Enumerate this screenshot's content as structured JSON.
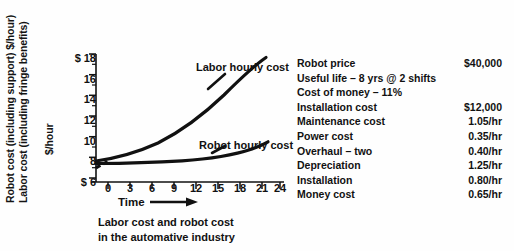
{
  "axis_labels": {
    "robot_cost": "Robot cost (including support) $/hour)",
    "labor_cost": "Labor cost (including fringe benefits)",
    "unit": "$/hour",
    "time": "Time"
  },
  "caption": {
    "line1": "Labor cost and robot cost",
    "line2": "in the automative industry"
  },
  "specs": {
    "rows": [
      {
        "label": "Robot price",
        "value": "$40,000"
      },
      {
        "label": "Useful life – 8 yrs @ 2 shifts",
        "value": ""
      },
      {
        "label": "Cost of money – 11%",
        "value": ""
      },
      {
        "label": "Installation cost",
        "value": "$12,000"
      },
      {
        "label": "Maintenance cost",
        "value": "1.05/hr"
      },
      {
        "label": "Power cost",
        "value": "0.35/hr"
      },
      {
        "label": "Overhaul – two",
        "value": "0.40/hr"
      },
      {
        "label": "Depreciation",
        "value": "1.25/hr"
      },
      {
        "label": "Installation",
        "value": "0.80/hr"
      },
      {
        "label": "Money cost",
        "value": "0.65/hr"
      }
    ]
  },
  "chart_data": {
    "type": "line",
    "title": "Labor cost and robot cost in the automative industry",
    "xlabel": "Time",
    "ylabel": "$/hour",
    "xlim": [
      -2,
      25
    ],
    "ylim": [
      5,
      18
    ],
    "grid": false,
    "legend": "inline-annotations",
    "xticks": [
      "0",
      "3",
      "6",
      "9",
      "12",
      "15",
      "18",
      "21",
      "24"
    ],
    "xtick_values": [
      0,
      3,
      6,
      9,
      12,
      15,
      18,
      21,
      24
    ],
    "yticks": [
      "$ 18",
      "16",
      "14",
      "12",
      "10",
      "8",
      "$  6"
    ],
    "ytick_values": [
      18,
      16,
      14,
      12,
      10,
      8,
      6
    ],
    "ytick_prefixes": [
      "$",
      "",
      "",
      "",
      "",
      "",
      "$"
    ],
    "minor_y_ticks": [
      7,
      9,
      11,
      13,
      15,
      17
    ],
    "series": [
      {
        "name": "Labor hourly cost",
        "label_text": "Labor hourly cost",
        "style": "solid",
        "x": [
          0,
          3,
          6,
          9,
          12,
          15,
          18,
          21,
          23.3
        ],
        "values": [
          7.0,
          7.4,
          8.0,
          8.9,
          10.1,
          11.7,
          13.6,
          15.8,
          17.3
        ]
      },
      {
        "name": "Robot hourly cost",
        "label_text": "Robot hourly cost",
        "style": "solid",
        "x": [
          0,
          3,
          6,
          9,
          12,
          15,
          18,
          21,
          23.3
        ],
        "values": [
          6.85,
          6.85,
          6.88,
          6.92,
          7.0,
          7.15,
          7.4,
          7.8,
          8.1
        ]
      },
      {
        "name": "origin dashed lead-in",
        "label_text": "",
        "style": "dashed",
        "x": [
          -1.6,
          -0.8,
          0
        ],
        "values": [
          6.1,
          6.5,
          6.9
        ]
      }
    ]
  }
}
